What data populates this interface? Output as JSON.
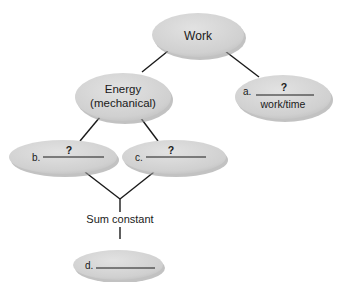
{
  "diagram": {
    "colors": {
      "node_fill": "#d4d4d4",
      "node_shadow": "#9a9a9a",
      "line": "#1a1a1a",
      "background": "#ffffff"
    },
    "nodes": {
      "work": {
        "label": "Work"
      },
      "energy": {
        "line1": "Energy",
        "line2": "(mechanical)"
      },
      "a": {
        "prefix": "a.",
        "blank": "?",
        "sub": "work/time"
      },
      "b": {
        "prefix": "b.",
        "blank": "?"
      },
      "c": {
        "prefix": "c.",
        "blank": "?"
      },
      "d": {
        "prefix": "d.",
        "blank": ""
      }
    },
    "connector_label": "Sum constant",
    "edges": [
      [
        "work",
        "energy"
      ],
      [
        "work",
        "a"
      ],
      [
        "energy",
        "b"
      ],
      [
        "energy",
        "c"
      ],
      [
        "b",
        "sum"
      ],
      [
        "c",
        "sum"
      ],
      [
        "sum",
        "d"
      ]
    ]
  }
}
